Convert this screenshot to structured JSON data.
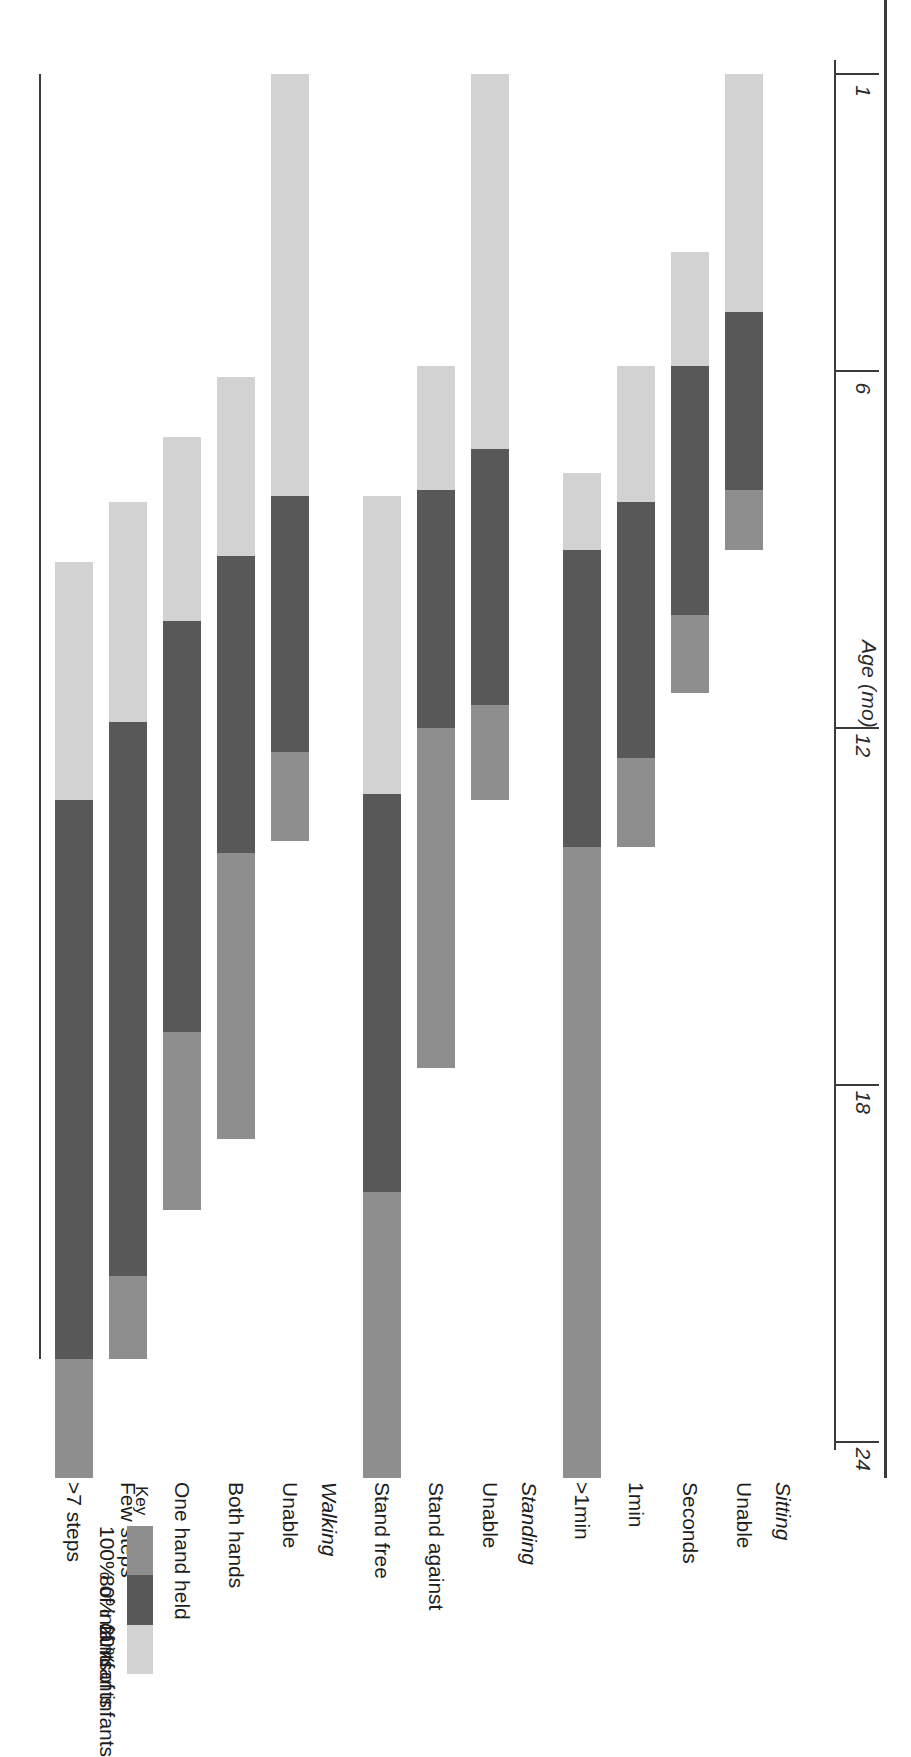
{
  "figure": {
    "axis_title": "Age (mo)",
    "axis_ticks": [
      "1",
      "6",
      "12",
      "18",
      "24"
    ]
  },
  "key": {
    "title": "Key",
    "labels": [
      "100% of infants",
      "80% of infants",
      "20% of infants"
    ],
    "colors": [
      "#8e8e8e",
      "#585858",
      "#d2d2d2"
    ]
  },
  "groups": [
    {
      "name": "Sitting",
      "rows": [
        "Unable",
        "Seconds",
        "1min",
        ">1min"
      ]
    },
    {
      "name": "Standing",
      "rows": [
        "Unable",
        "Stand against",
        "Stand free"
      ]
    },
    {
      "name": "Walking",
      "rows": [
        "Unable",
        "Both hands",
        "One hand held",
        "Few steps",
        ">7 steps"
      ]
    }
  ],
  "chart_data": {
    "type": "bar",
    "title": "Age (mo)",
    "xlabel": "Age (mo)",
    "ylabel": "",
    "xlim": [
      0,
      25
    ],
    "grid": false,
    "legend": [
      "100% of infants",
      "80% of infants",
      "20% of infants"
    ],
    "legend_position": "bottom-right",
    "note": "Horizontal stacked range bars. Each row spans an age window; segments give the 20%, 80% and 100% attainment bands in months.",
    "rows": [
      {
        "group": "Sitting",
        "label": "Unable",
        "segments": [
          {
            "band": "20%",
            "start": 1.0,
            "end": 5.0
          },
          {
            "band": "80%",
            "start": 5.0,
            "end": 8.0
          },
          {
            "band": "100%",
            "start": 8.0,
            "end": 9.0
          }
        ]
      },
      {
        "group": "Sitting",
        "label": "Seconds",
        "segments": [
          {
            "band": "20%",
            "start": 4.0,
            "end": 5.9
          },
          {
            "band": "80%",
            "start": 5.9,
            "end": 10.1
          },
          {
            "band": "100%",
            "start": 10.1,
            "end": 11.4
          }
        ]
      },
      {
        "group": "Sitting",
        "label": "1min",
        "segments": [
          {
            "band": "20%",
            "start": 5.9,
            "end": 8.2
          },
          {
            "band": "80%",
            "start": 8.2,
            "end": 12.5
          },
          {
            "band": "100%",
            "start": 12.5,
            "end": 14.0
          }
        ]
      },
      {
        "group": "Sitting",
        "label": ">1min",
        "segments": [
          {
            "band": "20%",
            "start": 7.7,
            "end": 9.0
          },
          {
            "band": "80%",
            "start": 9.0,
            "end": 14.0
          },
          {
            "band": "100%",
            "start": 14.0,
            "end": 24.6
          }
        ]
      },
      {
        "group": "Standing",
        "label": "Unable",
        "segments": [
          {
            "band": "20%",
            "start": 1.0,
            "end": 7.3
          },
          {
            "band": "80%",
            "start": 7.3,
            "end": 11.6
          },
          {
            "band": "100%",
            "start": 11.6,
            "end": 13.2
          }
        ]
      },
      {
        "group": "Standing",
        "label": "Stand against",
        "segments": [
          {
            "band": "20%",
            "start": 5.9,
            "end": 8.0
          },
          {
            "band": "80%",
            "start": 8.0,
            "end": 12.0
          },
          {
            "band": "100%",
            "start": 12.0,
            "end": 17.7
          }
        ]
      },
      {
        "group": "Standing",
        "label": "Stand free",
        "segments": [
          {
            "band": "20%",
            "start": 8.1,
            "end": 13.1
          },
          {
            "band": "80%",
            "start": 13.1,
            "end": 19.8
          },
          {
            "band": "100%",
            "start": 19.8,
            "end": 24.6
          }
        ]
      },
      {
        "group": "Walking",
        "label": "Unable",
        "segments": [
          {
            "band": "20%",
            "start": 1.0,
            "end": 8.1
          },
          {
            "band": "80%",
            "start": 8.1,
            "end": 12.4
          },
          {
            "band": "100%",
            "start": 12.4,
            "end": 13.9
          }
        ]
      },
      {
        "group": "Walking",
        "label": "Both hands",
        "segments": [
          {
            "band": "20%",
            "start": 6.1,
            "end": 9.1
          },
          {
            "band": "80%",
            "start": 9.1,
            "end": 14.1
          },
          {
            "band": "100%",
            "start": 14.1,
            "end": 18.9
          }
        ]
      },
      {
        "group": "Walking",
        "label": "One hand held",
        "segments": [
          {
            "band": "20%",
            "start": 7.1,
            "end": 10.2
          },
          {
            "band": "80%",
            "start": 10.2,
            "end": 17.1
          },
          {
            "band": "100%",
            "start": 17.1,
            "end": 20.1
          }
        ]
      },
      {
        "group": "Walking",
        "label": "Few steps",
        "segments": [
          {
            "band": "20%",
            "start": 8.2,
            "end": 11.9
          },
          {
            "band": "80%",
            "start": 11.9,
            "end": 21.2
          },
          {
            "band": "100%",
            "start": 21.2,
            "end": 22.6
          }
        ]
      },
      {
        "group": "Walking",
        "label": ">7 steps",
        "segments": [
          {
            "band": "20%",
            "start": 9.2,
            "end": 13.2
          },
          {
            "band": "80%",
            "start": 13.2,
            "end": 22.6
          },
          {
            "band": "100%",
            "start": 22.6,
            "end": 24.6
          }
        ]
      }
    ]
  }
}
